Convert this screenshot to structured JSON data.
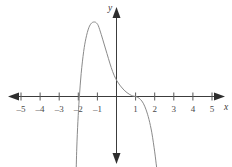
{
  "chart_data": {
    "type": "line",
    "title": "",
    "xlabel": "x",
    "ylabel": "y",
    "grid": false,
    "legend": null,
    "xlim": [
      -6.0,
      6.1
    ],
    "ylim": [
      -4.2,
      5.0
    ],
    "xticks": [
      -5,
      -4,
      -3,
      -2,
      -1,
      1,
      2,
      3,
      4,
      5
    ],
    "xtick_labels": [
      "–5",
      "–4",
      "–3",
      "–2",
      "–1",
      "1",
      "2",
      "3",
      "4",
      "5"
    ],
    "yticks": [],
    "ytick_labels": [],
    "axis_arrows": [
      "left",
      "right",
      "up",
      "down"
    ],
    "annotations": [],
    "series": [
      {
        "name": "polynomial curve",
        "description": "Curve rises steeply from below the frame near x = -2, crosses the x-axis at x = -2, peaks near x = -1.1, decreases through the y-axis, flattens against the x-axis near x = 1, then falls steeply off the bottom of the frame near x = 2.1",
        "x_intercepts": [
          -2,
          1
        ],
        "local_maximum": [
          -1.1,
          3.9
        ],
        "y_intercept": 0.9,
        "x": [
          -2.12,
          -2.08,
          -2.02,
          -1.95,
          -1.85,
          -1.72,
          -1.6,
          -1.45,
          -1.3,
          -1.15,
          -1.05,
          -0.95,
          -0.8,
          -0.65,
          -0.5,
          -0.35,
          -0.2,
          -0.05,
          0.1,
          0.25,
          0.4,
          0.55,
          0.7,
          0.85,
          1.0,
          1.12,
          1.25,
          1.4,
          1.55,
          1.7,
          1.85,
          2.0,
          2.1,
          2.18
        ],
        "y": [
          -4.2,
          -2.7,
          -1.3,
          -0.1,
          1.2,
          2.35,
          3.05,
          3.6,
          3.85,
          3.9,
          3.85,
          3.7,
          3.25,
          2.75,
          2.25,
          1.75,
          1.3,
          0.95,
          0.7,
          0.5,
          0.33,
          0.2,
          0.1,
          0.03,
          0.0,
          -0.05,
          -0.15,
          -0.35,
          -0.7,
          -1.2,
          -1.9,
          -2.9,
          -3.7,
          -4.2
        ]
      }
    ]
  },
  "figure": {
    "background_color": "#ffffff",
    "curve_color": "#8a8a8a",
    "axis_color": "#3c3c3c",
    "label_color": "#4a4a4a"
  }
}
